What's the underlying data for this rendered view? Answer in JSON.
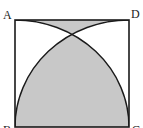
{
  "diagram": {
    "type": "geometry",
    "shape": "square",
    "vertices": [
      {
        "name": "A",
        "label": "A"
      },
      {
        "name": "B",
        "label": "B"
      },
      {
        "name": "C",
        "label": "C"
      },
      {
        "name": "D",
        "label": "D"
      }
    ],
    "arcs": [
      {
        "center": "B",
        "from": "A",
        "to": "C"
      },
      {
        "center": "C",
        "from": "B",
        "to": "D"
      }
    ],
    "shaded_regions": [
      "region between arcs near top side AD",
      "region bounded by both arcs above side BC"
    ],
    "colors": {
      "line": "#1a1a1a",
      "shade": "#c8c8c8",
      "background": "#ffffff"
    }
  }
}
